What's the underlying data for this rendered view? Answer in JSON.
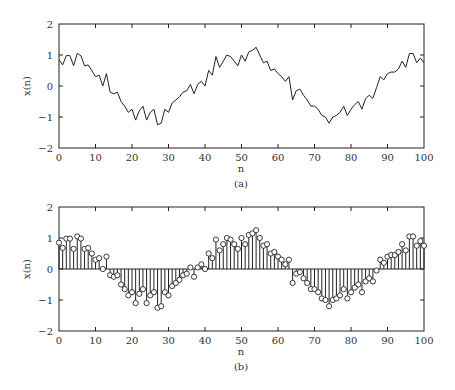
{
  "figure": {
    "captions": [
      "(a)",
      "(b)"
    ]
  },
  "chart_data": [
    {
      "type": "line",
      "title": "",
      "caption": "(a)",
      "xlabel": "n",
      "ylabel": "x(n)",
      "xlim": [
        0,
        100
      ],
      "ylim": [
        -2,
        2
      ],
      "xticks": [
        0,
        10,
        20,
        30,
        40,
        50,
        60,
        70,
        80,
        90,
        100
      ],
      "yticks": [
        -2,
        -1,
        0,
        1,
        2
      ],
      "grid": false,
      "color": "#222222",
      "x": [
        0,
        1,
        2,
        3,
        4,
        5,
        6,
        7,
        8,
        9,
        10,
        11,
        12,
        13,
        14,
        15,
        16,
        17,
        18,
        19,
        20,
        21,
        22,
        23,
        24,
        25,
        26,
        27,
        28,
        29,
        30,
        31,
        32,
        33,
        34,
        35,
        36,
        37,
        38,
        39,
        40,
        41,
        42,
        43,
        44,
        45,
        46,
        47,
        48,
        49,
        50,
        51,
        52,
        53,
        54,
        55,
        56,
        57,
        58,
        59,
        60,
        61,
        62,
        63,
        64,
        65,
        66,
        67,
        68,
        69,
        70,
        71,
        72,
        73,
        74,
        75,
        76,
        77,
        78,
        79,
        80,
        81,
        82,
        83,
        84,
        85,
        86,
        87,
        88,
        89,
        90,
        91,
        92,
        93,
        94,
        95,
        96,
        97,
        98,
        99,
        100
      ],
      "values": [
        0.85,
        0.68,
        0.98,
        0.98,
        0.65,
        1.05,
        0.98,
        0.65,
        0.68,
        0.5,
        0.3,
        0.35,
        0.0,
        0.4,
        -0.2,
        -0.25,
        -0.2,
        -0.5,
        -0.65,
        -0.85,
        -0.75,
        -1.1,
        -0.8,
        -0.65,
        -1.1,
        -0.85,
        -0.75,
        -1.25,
        -1.2,
        -0.75,
        -0.85,
        -0.55,
        -0.45,
        -0.35,
        -0.2,
        -0.15,
        0.05,
        -0.25,
        0.05,
        0.15,
        0.0,
        0.5,
        0.35,
        0.95,
        0.6,
        0.8,
        1.0,
        0.95,
        0.8,
        0.65,
        1.0,
        0.8,
        1.1,
        1.15,
        1.25,
        1.0,
        0.75,
        0.8,
        0.5,
        0.55,
        0.4,
        0.3,
        0.15,
        0.3,
        -0.45,
        -0.15,
        -0.1,
        -0.3,
        -0.45,
        -0.65,
        -0.65,
        -0.75,
        -0.95,
        -1.0,
        -1.2,
        -1.0,
        -0.95,
        -0.85,
        -0.65,
        -0.95,
        -0.75,
        -0.6,
        -0.5,
        -0.75,
        -0.4,
        -0.3,
        -0.4,
        -0.05,
        0.3,
        0.2,
        0.4,
        0.45,
        0.45,
        0.55,
        0.8,
        0.6,
        1.05,
        1.05,
        0.75,
        0.9,
        0.75
      ]
    },
    {
      "type": "stem",
      "title": "",
      "caption": "(b)",
      "xlabel": "n",
      "ylabel": "x(n)",
      "xlim": [
        0,
        100
      ],
      "ylim": [
        -2,
        2
      ],
      "xticks": [
        0,
        10,
        20,
        30,
        40,
        50,
        60,
        70,
        80,
        90,
        100
      ],
      "yticks": [
        -2,
        -1,
        0,
        1,
        2
      ],
      "grid": false,
      "marker": "open-circle",
      "color": "#222222",
      "x": [
        0,
        1,
        2,
        3,
        4,
        5,
        6,
        7,
        8,
        9,
        10,
        11,
        12,
        13,
        14,
        15,
        16,
        17,
        18,
        19,
        20,
        21,
        22,
        23,
        24,
        25,
        26,
        27,
        28,
        29,
        30,
        31,
        32,
        33,
        34,
        35,
        36,
        37,
        38,
        39,
        40,
        41,
        42,
        43,
        44,
        45,
        46,
        47,
        48,
        49,
        50,
        51,
        52,
        53,
        54,
        55,
        56,
        57,
        58,
        59,
        60,
        61,
        62,
        63,
        64,
        65,
        66,
        67,
        68,
        69,
        70,
        71,
        72,
        73,
        74,
        75,
        76,
        77,
        78,
        79,
        80,
        81,
        82,
        83,
        84,
        85,
        86,
        87,
        88,
        89,
        90,
        91,
        92,
        93,
        94,
        95,
        96,
        97,
        98,
        99,
        100
      ],
      "values": [
        0.85,
        0.68,
        0.98,
        0.98,
        0.65,
        1.05,
        0.98,
        0.65,
        0.68,
        0.5,
        0.3,
        0.35,
        0.0,
        0.4,
        -0.2,
        -0.25,
        -0.2,
        -0.5,
        -0.65,
        -0.85,
        -0.75,
        -1.1,
        -0.8,
        -0.65,
        -1.1,
        -0.85,
        -0.75,
        -1.25,
        -1.2,
        -0.75,
        -0.85,
        -0.55,
        -0.45,
        -0.35,
        -0.2,
        -0.15,
        0.05,
        -0.25,
        0.05,
        0.15,
        0.0,
        0.5,
        0.35,
        0.95,
        0.6,
        0.8,
        1.0,
        0.95,
        0.8,
        0.65,
        1.0,
        0.8,
        1.1,
        1.15,
        1.25,
        1.0,
        0.75,
        0.8,
        0.5,
        0.55,
        0.4,
        0.3,
        0.15,
        0.3,
        -0.45,
        -0.15,
        -0.1,
        -0.3,
        -0.45,
        -0.65,
        -0.65,
        -0.75,
        -0.95,
        -1.0,
        -1.2,
        -1.0,
        -0.95,
        -0.85,
        -0.65,
        -0.95,
        -0.75,
        -0.6,
        -0.5,
        -0.75,
        -0.4,
        -0.3,
        -0.4,
        -0.05,
        0.3,
        0.2,
        0.4,
        0.45,
        0.45,
        0.55,
        0.8,
        0.6,
        1.05,
        1.05,
        0.75,
        0.9,
        0.75
      ]
    }
  ]
}
